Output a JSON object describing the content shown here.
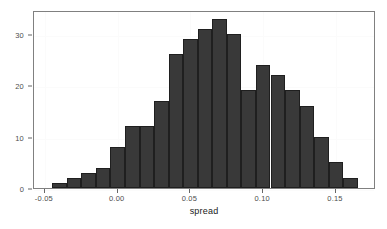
{
  "chart_data": {
    "type": "bar",
    "subtype": "histogram",
    "title": "",
    "subtitle": "",
    "xlabel": "spread",
    "ylabel": "",
    "xlim": [
      -0.0575,
      0.1775
    ],
    "ylim": [
      0,
      34.65
    ],
    "grid": true,
    "legend": null,
    "bin_width": 0.01,
    "x_tick_labels": [
      "-0.05",
      "0.00",
      "0.05",
      "0.10",
      "0.15"
    ],
    "x_tick_values": [
      -0.05,
      0.0,
      0.05,
      0.1,
      0.15
    ],
    "y_tick_labels": [
      "0",
      "10",
      "20",
      "30"
    ],
    "y_tick_values": [
      0,
      10,
      20,
      30
    ],
    "bin_starts": [
      -0.045,
      -0.035,
      -0.025,
      -0.015,
      -0.005,
      0.005,
      0.015,
      0.025,
      0.035,
      0.045,
      0.055,
      0.065,
      0.075,
      0.085,
      0.095,
      0.105,
      0.115,
      0.125,
      0.135,
      0.145,
      0.155
    ],
    "bin_centers": [
      -0.04,
      -0.03,
      -0.02,
      -0.01,
      0.0,
      0.01,
      0.02,
      0.03,
      0.04,
      0.05,
      0.06,
      0.07,
      0.08,
      0.09,
      0.1,
      0.11,
      0.12,
      0.13,
      0.14,
      0.15,
      0.16
    ],
    "values": [
      1,
      2,
      3,
      4,
      8,
      12,
      12,
      17,
      26,
      29,
      31,
      33,
      30,
      19,
      24,
      22,
      19,
      16,
      10,
      5,
      2
    ],
    "categories": [
      "-0.04",
      "-0.03",
      "-0.02",
      "-0.01",
      "0.00",
      "0.01",
      "0.02",
      "0.03",
      "0.04",
      "0.05",
      "0.06",
      "0.07",
      "0.08",
      "0.09",
      "0.10",
      "0.11",
      "0.12",
      "0.13",
      "0.14",
      "0.15",
      "0.16"
    ],
    "colors": {
      "bar_fill": "#393939",
      "bar_border": "#1f1f1f",
      "panel_background": "#ffffff",
      "panel_border": "#808080",
      "gridline": "#fbfbfb",
      "tick_label": "#4d4d4d",
      "axis_title": "#1a1a1a"
    }
  }
}
